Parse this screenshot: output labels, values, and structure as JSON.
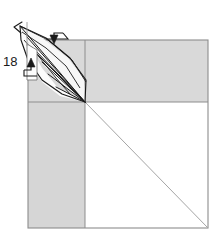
{
  "figure": {
    "kind": "origami-folding-diagram",
    "step_number": "18",
    "background_color": "#ffffff",
    "paper_shade_color": "#d9d9d9",
    "paper_shade_color_dark": "#d2d2d2",
    "paper_white_color": "#ffffff",
    "crease_line_color": "#808080",
    "outline_color": "#8a8a8a",
    "fold_line_color": "#1a1a1a"
  },
  "labels": {
    "step_number": "18"
  },
  "icons": {
    "valley_fold_arrow": "fold-arrow-down-left-icon",
    "tuck_fold_arrow": "fold-arrow-up-right-icon",
    "apex_tip_marker": "point-tip-icon"
  },
  "geometry": {
    "square": {
      "left": 28,
      "top": 40,
      "right": 208,
      "bottom": 228
    },
    "center_point": {
      "x": 85,
      "y": 102
    },
    "horizontal_crease_y": 102,
    "vertical_crease_x": 85,
    "diagonal": {
      "x1": 85,
      "y1": 102,
      "x2": 208,
      "y2": 228
    },
    "flap_apex": {
      "x": 20,
      "y": 26
    },
    "lens_upper_vertex": {
      "x": 28,
      "y": 30
    },
    "lens_lower_vertex": {
      "x": 85,
      "y": 102
    }
  },
  "shaded_regions": [
    {
      "name": "top-band",
      "description": "shaded band across top of square above horizontal crease"
    },
    {
      "name": "lower-left-quadrant",
      "description": "shaded rectangle left of vertical crease below horizontal crease"
    }
  ],
  "white_regions": [
    {
      "name": "lower-right-quadrant",
      "description": "white square region right of vertical crease below horizontal crease, split by diagonal crease"
    },
    {
      "name": "flap-lens",
      "description": "white spindle/lens shaped folded flap extending up-left from center point"
    }
  ],
  "radiating_creases_count": 7
}
